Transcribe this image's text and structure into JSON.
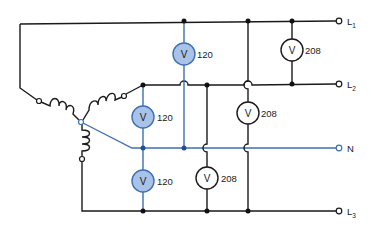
{
  "diagram": {
    "type": "three-phase-wye-circuit",
    "colors": {
      "line_wire": "#1a1a1a",
      "neutral_wire": "#3f6fb5",
      "phase_meter_fill": "#a9c3e8",
      "line_meter_fill": "#ffffff"
    },
    "terminals": [
      {
        "name": "L",
        "sub": "1"
      },
      {
        "name": "L",
        "sub": "2"
      },
      {
        "name": "N",
        "sub": ""
      },
      {
        "name": "L",
        "sub": "3"
      }
    ],
    "voltmeters": [
      {
        "symbol": "V",
        "reading": "120",
        "between": "L1-N"
      },
      {
        "symbol": "V",
        "reading": "120",
        "between": "L2-N"
      },
      {
        "symbol": "V",
        "reading": "120",
        "between": "N-L3"
      },
      {
        "symbol": "V",
        "reading": "208",
        "between": "L1-L2"
      },
      {
        "symbol": "V",
        "reading": "208",
        "between": "L1-L3"
      },
      {
        "symbol": "V",
        "reading": "208",
        "between": "L2-L3"
      }
    ]
  }
}
